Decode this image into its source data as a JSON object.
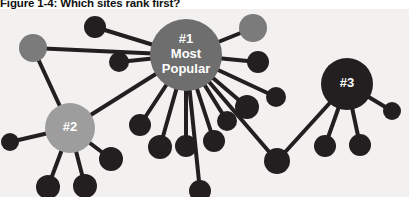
{
  "figure": {
    "caption": "Figure 1-4: Which sites rank first?",
    "background_color": "#f2f1ef",
    "page_color": "#ffffff"
  },
  "palette": {
    "edge": "#231f20",
    "node_dark": "#231f20",
    "node_mid_gray": "#7b7b7b",
    "node_light_gray": "#9d9d9d",
    "hub_one_fill": "#6e6e6e",
    "hub_two_fill": "#9d9d9d",
    "hub_three_fill": "#231f20",
    "label_text": "#ffffff"
  },
  "hubs": [
    {
      "id": "hub-1",
      "rank_label": "#1",
      "line_two": "Most",
      "line_three": "Popular",
      "cx": 186,
      "cy": 46,
      "r": 36,
      "fill": "#6e6e6e",
      "font_size": 13
    },
    {
      "id": "hub-2",
      "rank_label": "#2",
      "line_two": "",
      "line_three": "",
      "cx": 70,
      "cy": 119,
      "r": 25,
      "fill": "#9d9d9d",
      "font_size": 13
    },
    {
      "id": "hub-3",
      "rank_label": "#3",
      "line_two": "",
      "line_three": "",
      "cx": 347,
      "cy": 75,
      "r": 26,
      "fill": "#231f20",
      "font_size": 13
    }
  ],
  "nodes": [
    {
      "id": "n-top-left-dark",
      "cx": 95,
      "cy": 18,
      "r": 11,
      "fill": "#231f20"
    },
    {
      "id": "n-left-mid-gray",
      "cx": 33,
      "cy": 39,
      "r": 14,
      "fill": "#7b7b7b"
    },
    {
      "id": "n-inner-left-dark",
      "cx": 119,
      "cy": 53,
      "r": 10,
      "fill": "#231f20"
    },
    {
      "id": "n-top-right-gray",
      "cx": 253,
      "cy": 19,
      "r": 14,
      "fill": "#7b7b7b"
    },
    {
      "id": "n-right-upper-dark",
      "cx": 258,
      "cy": 53,
      "r": 11,
      "fill": "#231f20"
    },
    {
      "id": "n-right-a-dark",
      "cx": 247,
      "cy": 98,
      "r": 12,
      "fill": "#231f20"
    },
    {
      "id": "n-right-b-dark",
      "cx": 276,
      "cy": 88,
      "r": 10,
      "fill": "#231f20"
    },
    {
      "id": "n-spoke-1-dark",
      "cx": 140,
      "cy": 116,
      "r": 11,
      "fill": "#231f20"
    },
    {
      "id": "n-spoke-2-dark",
      "cx": 160,
      "cy": 138,
      "r": 12,
      "fill": "#231f20"
    },
    {
      "id": "n-spoke-3-dark",
      "cx": 186,
      "cy": 137,
      "r": 11,
      "fill": "#231f20"
    },
    {
      "id": "n-spoke-4-dark",
      "cx": 214,
      "cy": 132,
      "r": 11,
      "fill": "#231f20"
    },
    {
      "id": "n-spoke-5-dark",
      "cx": 227,
      "cy": 112,
      "r": 10,
      "fill": "#231f20"
    },
    {
      "id": "n-bridge-dark",
      "cx": 277,
      "cy": 152,
      "r": 13,
      "fill": "#231f20"
    },
    {
      "id": "n-hub2-left-dark",
      "cx": 10,
      "cy": 133,
      "r": 9,
      "fill": "#231f20"
    },
    {
      "id": "n-hub2-bottom-a-dark",
      "cx": 48,
      "cy": 178,
      "r": 12,
      "fill": "#231f20"
    },
    {
      "id": "n-hub2-bottom-b-dark",
      "cx": 85,
      "cy": 177,
      "r": 12,
      "fill": "#231f20"
    },
    {
      "id": "n-hub2-right-dark",
      "cx": 111,
      "cy": 150,
      "r": 12,
      "fill": "#231f20"
    },
    {
      "id": "n-hub3-right-dark",
      "cx": 392,
      "cy": 102,
      "r": 9,
      "fill": "#231f20"
    },
    {
      "id": "n-hub3-bottom-a-dark",
      "cx": 325,
      "cy": 137,
      "r": 11,
      "fill": "#231f20"
    },
    {
      "id": "n-hub3-bottom-b-dark",
      "cx": 360,
      "cy": 136,
      "r": 11,
      "fill": "#231f20"
    },
    {
      "id": "n-far-left-bottom-dark",
      "cx": 200,
      "cy": 182,
      "r": 11,
      "fill": "#231f20"
    }
  ],
  "edges": [
    {
      "id": "e-hub1-topleft",
      "x1": 186,
      "y1": 46,
      "x2": 95,
      "y2": 18,
      "width": 4
    },
    {
      "id": "e-hub1-leftgray",
      "x1": 186,
      "y1": 46,
      "x2": 33,
      "y2": 39,
      "width": 4
    },
    {
      "id": "e-hub1-innerleft",
      "x1": 186,
      "y1": 46,
      "x2": 119,
      "y2": 53,
      "width": 4
    },
    {
      "id": "e-hub1-topright",
      "x1": 186,
      "y1": 46,
      "x2": 253,
      "y2": 19,
      "width": 4
    },
    {
      "id": "e-hub1-rightupper",
      "x1": 186,
      "y1": 46,
      "x2": 258,
      "y2": 53,
      "width": 4
    },
    {
      "id": "e-hub1-righta",
      "x1": 186,
      "y1": 46,
      "x2": 247,
      "y2": 98,
      "width": 4
    },
    {
      "id": "e-hub1-rightb",
      "x1": 186,
      "y1": 46,
      "x2": 276,
      "y2": 88,
      "width": 4
    },
    {
      "id": "e-hub1-spoke1",
      "x1": 186,
      "y1": 46,
      "x2": 140,
      "y2": 116,
      "width": 4
    },
    {
      "id": "e-hub1-spoke2",
      "x1": 186,
      "y1": 46,
      "x2": 160,
      "y2": 138,
      "width": 4
    },
    {
      "id": "e-hub1-spoke3",
      "x1": 186,
      "y1": 46,
      "x2": 186,
      "y2": 137,
      "width": 4
    },
    {
      "id": "e-hub1-spoke4",
      "x1": 186,
      "y1": 46,
      "x2": 214,
      "y2": 132,
      "width": 4
    },
    {
      "id": "e-hub1-spoke5",
      "x1": 186,
      "y1": 46,
      "x2": 227,
      "y2": 112,
      "width": 4
    },
    {
      "id": "e-hub1-bridge",
      "x1": 186,
      "y1": 46,
      "x2": 277,
      "y2": 152,
      "width": 4
    },
    {
      "id": "e-hub1-farleftbottom",
      "x1": 186,
      "y1": 46,
      "x2": 200,
      "y2": 182,
      "width": 4
    },
    {
      "id": "e-bridge-hub3",
      "x1": 277,
      "y1": 152,
      "x2": 347,
      "y2": 75,
      "width": 4
    },
    {
      "id": "e-leftgray-hub2",
      "x1": 33,
      "y1": 39,
      "x2": 70,
      "y2": 119,
      "width": 4
    },
    {
      "id": "e-hub2-left",
      "x1": 70,
      "y1": 119,
      "x2": 10,
      "y2": 133,
      "width": 4
    },
    {
      "id": "e-hub2-bottoma",
      "x1": 70,
      "y1": 119,
      "x2": 48,
      "y2": 178,
      "width": 4
    },
    {
      "id": "e-hub2-bottomb",
      "x1": 70,
      "y1": 119,
      "x2": 85,
      "y2": 177,
      "width": 4
    },
    {
      "id": "e-hub2-right",
      "x1": 70,
      "y1": 119,
      "x2": 111,
      "y2": 150,
      "width": 4
    },
    {
      "id": "e-hub2-hub1",
      "x1": 70,
      "y1": 119,
      "x2": 186,
      "y2": 46,
      "width": 4
    },
    {
      "id": "e-hub3-right",
      "x1": 347,
      "y1": 75,
      "x2": 392,
      "y2": 102,
      "width": 4
    },
    {
      "id": "e-hub3-bottoma",
      "x1": 347,
      "y1": 75,
      "x2": 325,
      "y2": 137,
      "width": 4
    },
    {
      "id": "e-hub3-bottomb",
      "x1": 347,
      "y1": 75,
      "x2": 360,
      "y2": 136,
      "width": 4
    }
  ]
}
